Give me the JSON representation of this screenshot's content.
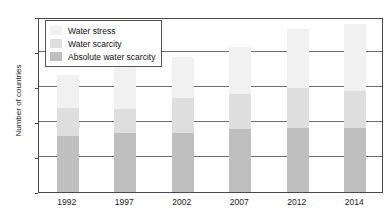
{
  "chart_data": {
    "type": "bar",
    "subtype": "stacked-vertical",
    "title": "",
    "xlabel": "",
    "ylabel": "Number of countries",
    "categories": [
      "1992",
      "1997",
      "2002",
      "2007",
      "2012",
      "2014"
    ],
    "ylim": [
      0,
      50
    ],
    "yticks": [
      0,
      10,
      20,
      30,
      40,
      50
    ],
    "grid": true,
    "legend_position": "top-left",
    "series": [
      {
        "name": "Absolute water scarcity",
        "color": "#bfbfbf",
        "values": [
          16,
          16.8,
          16.8,
          18,
          18.3,
          18.3
        ]
      },
      {
        "name": "Water scarcity",
        "color": "#dedede",
        "values": [
          8,
          6.9,
          10.2,
          10,
          11.4,
          10.7
        ]
      },
      {
        "name": "Water stress",
        "color": "#f1f1f1",
        "values": [
          9.5,
          14.8,
          11.5,
          13.5,
          16.8,
          19
        ]
      }
    ],
    "totals": [
      33.5,
      38.5,
      38.5,
      41.5,
      46.5,
      48
    ]
  },
  "legend": {
    "items": [
      {
        "label": "Water stress",
        "color": "#f1f1f1"
      },
      {
        "label": "Water scarcity",
        "color": "#dedede"
      },
      {
        "label": "Absolute water scarcity",
        "color": "#bfbfbf"
      }
    ]
  }
}
